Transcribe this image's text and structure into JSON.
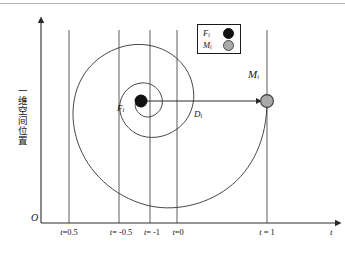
{
  "figure": {
    "type": "diagram",
    "axes": {
      "origin_label": "O",
      "x_axis_label": "t",
      "y_axis_label": "一维空间位置",
      "x_ticks": [
        {
          "label_prefix": "t",
          "label_value": "=0.5",
          "x": 69
        },
        {
          "label_prefix": "t",
          "label_value": "= -0.5",
          "x": 119
        },
        {
          "label_prefix": "t",
          "label_value": "= -1",
          "x": 150
        },
        {
          "label_prefix": "t",
          "label_value": "=0",
          "x": 177
        },
        {
          "label_prefix": "t",
          "label_value": " = 1",
          "x": 267
        }
      ]
    },
    "legend": {
      "items": [
        {
          "symbol": "F",
          "subscript": "i",
          "marker": "filled-circle",
          "color": "#111111"
        },
        {
          "symbol": "M",
          "subscript": "i",
          "marker": "gray-circle",
          "color": "#a9a9a9"
        }
      ]
    },
    "annotations": [
      {
        "name": "center-point-label",
        "symbol": "F",
        "subscript": "i"
      },
      {
        "name": "moving-point-label",
        "symbol": "M",
        "subscript": "i"
      },
      {
        "name": "distance-label",
        "symbol": "D",
        "subscript": "i"
      }
    ],
    "points": [
      {
        "name": "F_i",
        "x": 141,
        "y": 101,
        "radius": 6.5,
        "fill": "#111111"
      },
      {
        "name": "M_i",
        "x": 267,
        "y": 101,
        "radius": 6.5,
        "fill": "#a9a9a9"
      }
    ],
    "colors": {
      "stroke": "#3d3d3d",
      "axis": "#2a2a2a",
      "marker_black": "#111111",
      "marker_gray": "#a9a9a9",
      "background": "#ffffff"
    }
  }
}
